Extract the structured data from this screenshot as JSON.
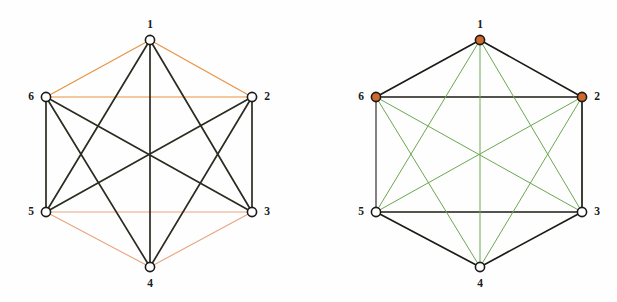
{
  "figure": {
    "caption": "",
    "background_color": "#fefefe",
    "panel_count": 2
  },
  "palette": {
    "orange_edge": "#e8913f",
    "salmon_edge": "#e8a37e",
    "dark_edge": "#2b2b20",
    "green_edge": "#6aa84f",
    "black_edge": "#1c1c16",
    "node_fill_empty": "#ffffff",
    "node_fill_marked": "#d2692c",
    "node_stroke": "#1b1b1b",
    "label_color": "#1b1b1b"
  },
  "chart_data": {
    "type": "diagram",
    "title": "",
    "graphs": [
      {
        "name": "left-graph",
        "vertex_count": 6,
        "edge_count": 15,
        "center": {
          "x": 150,
          "y": 154
        },
        "vertices": [
          {
            "id": "1",
            "label": "1",
            "x": 150,
            "y": 40,
            "fill": "#ffffff",
            "label_dx": 0,
            "label_dy": -15
          },
          {
            "id": "2",
            "label": "2",
            "x": 252,
            "y": 97,
            "fill": "#ffffff",
            "label_dx": 15,
            "label_dy": 0
          },
          {
            "id": "3",
            "label": "3",
            "x": 252,
            "y": 212,
            "fill": "#ffffff",
            "label_dx": 15,
            "label_dy": 0
          },
          {
            "id": "4",
            "label": "4",
            "x": 150,
            "y": 267,
            "fill": "#ffffff",
            "label_dx": 0,
            "label_dy": 17
          },
          {
            "id": "5",
            "label": "5",
            "x": 46,
            "y": 212,
            "fill": "#ffffff",
            "label_dx": -15,
            "label_dy": 0
          },
          {
            "id": "6",
            "label": "6",
            "x": 46,
            "y": 97,
            "fill": "#ffffff",
            "label_dx": -15,
            "label_dy": 0
          }
        ],
        "edges": [
          {
            "from": "1",
            "to": "2",
            "color": "#e8913f",
            "width": 1.1,
            "class": "orange"
          },
          {
            "from": "1",
            "to": "6",
            "color": "#e8913f",
            "width": 1.1,
            "class": "orange"
          },
          {
            "from": "6",
            "to": "2",
            "color": "#e8913f",
            "width": 1.1,
            "class": "orange"
          },
          {
            "from": "4",
            "to": "5",
            "color": "#e8a37e",
            "width": 1.1,
            "class": "orange"
          },
          {
            "from": "4",
            "to": "3",
            "color": "#e8a37e",
            "width": 1.1,
            "class": "orange"
          },
          {
            "from": "5",
            "to": "3",
            "color": "#e8a37e",
            "width": 1.1,
            "class": "orange"
          },
          {
            "from": "6",
            "to": "5",
            "color": "#2b2b20",
            "width": 1.7,
            "class": "dark"
          },
          {
            "from": "2",
            "to": "3",
            "color": "#2b2b20",
            "width": 1.7,
            "class": "dark"
          },
          {
            "from": "1",
            "to": "4",
            "color": "#2b2b20",
            "width": 1.7,
            "class": "dark"
          },
          {
            "from": "1",
            "to": "3",
            "color": "#2b2b20",
            "width": 1.7,
            "class": "dark"
          },
          {
            "from": "1",
            "to": "5",
            "color": "#2b2b20",
            "width": 1.7,
            "class": "dark"
          },
          {
            "from": "6",
            "to": "3",
            "color": "#2b2b20",
            "width": 1.7,
            "class": "dark"
          },
          {
            "from": "6",
            "to": "4",
            "color": "#2b2b20",
            "width": 1.7,
            "class": "dark"
          },
          {
            "from": "2",
            "to": "5",
            "color": "#2b2b20",
            "width": 1.7,
            "class": "dark"
          },
          {
            "from": "2",
            "to": "4",
            "color": "#2b2b20",
            "width": 1.7,
            "class": "dark"
          }
        ]
      },
      {
        "name": "right-graph",
        "vertex_count": 6,
        "edge_count": 15,
        "center": {
          "x": 172,
          "y": 154
        },
        "vertices": [
          {
            "id": "1",
            "label": "1",
            "x": 172,
            "y": 40,
            "fill": "#d2692c",
            "label_dx": 0,
            "label_dy": -15
          },
          {
            "id": "2",
            "label": "2",
            "x": 274,
            "y": 97,
            "fill": "#d2692c",
            "label_dx": 15,
            "label_dy": 0
          },
          {
            "id": "3",
            "label": "3",
            "x": 274,
            "y": 212,
            "fill": "#ffffff",
            "label_dx": 15,
            "label_dy": 0
          },
          {
            "id": "4",
            "label": "4",
            "x": 172,
            "y": 267,
            "fill": "#ffffff",
            "label_dx": 0,
            "label_dy": 17
          },
          {
            "id": "5",
            "label": "5",
            "x": 68,
            "y": 212,
            "fill": "#ffffff",
            "label_dx": -15,
            "label_dy": 0
          },
          {
            "id": "6",
            "label": "6",
            "x": 68,
            "y": 97,
            "fill": "#d2692c",
            "label_dx": -15,
            "label_dy": 0
          }
        ],
        "edges": [
          {
            "from": "1",
            "to": "2",
            "color": "#1c1c16",
            "width": 1.7,
            "class": "black"
          },
          {
            "from": "1",
            "to": "6",
            "color": "#1c1c16",
            "width": 1.7,
            "class": "black"
          },
          {
            "from": "6",
            "to": "2",
            "color": "#1c1c16",
            "width": 1.7,
            "class": "black"
          },
          {
            "from": "6",
            "to": "5",
            "color": "#1c1c16",
            "width": 1.1,
            "class": "black"
          },
          {
            "from": "2",
            "to": "3",
            "color": "#1c1c16",
            "width": 1.7,
            "class": "black"
          },
          {
            "from": "5",
            "to": "3",
            "color": "#1c1c16",
            "width": 1.7,
            "class": "black"
          },
          {
            "from": "4",
            "to": "5",
            "color": "#1c1c16",
            "width": 1.7,
            "class": "black"
          },
          {
            "from": "4",
            "to": "3",
            "color": "#1c1c16",
            "width": 1.7,
            "class": "black"
          },
          {
            "from": "1",
            "to": "4",
            "color": "#6aa84f",
            "width": 1.0,
            "class": "green"
          },
          {
            "from": "1",
            "to": "3",
            "color": "#6aa84f",
            "width": 1.0,
            "class": "green"
          },
          {
            "from": "1",
            "to": "5",
            "color": "#6aa84f",
            "width": 1.0,
            "class": "green"
          },
          {
            "from": "6",
            "to": "3",
            "color": "#6aa84f",
            "width": 1.0,
            "class": "green"
          },
          {
            "from": "6",
            "to": "4",
            "color": "#6aa84f",
            "width": 1.0,
            "class": "green"
          },
          {
            "from": "2",
            "to": "5",
            "color": "#6aa84f",
            "width": 1.0,
            "class": "green"
          },
          {
            "from": "2",
            "to": "4",
            "color": "#6aa84f",
            "width": 1.0,
            "class": "green"
          }
        ]
      }
    ]
  }
}
